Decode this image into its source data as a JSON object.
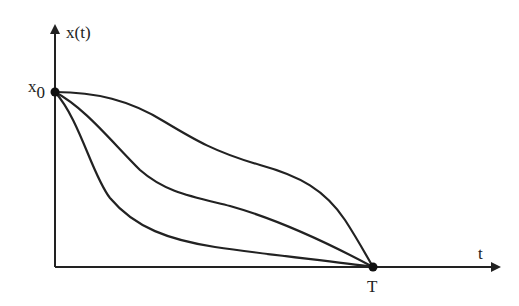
{
  "diagram": {
    "y_axis_label": "x(t)",
    "x_axis_label": "t",
    "start_point_label": "x",
    "start_point_subscript": "0",
    "end_point_label": "T",
    "curves": [
      {
        "name": "slow-decay-trajectory",
        "description": "stays near x0 then drops steeply near T"
      },
      {
        "name": "medium-decay-trajectory",
        "description": "intermediate decay to zero at T"
      },
      {
        "name": "fast-decay-trajectory",
        "description": "drops quickly then approaches zero at T"
      }
    ],
    "line_color": "#222222"
  }
}
